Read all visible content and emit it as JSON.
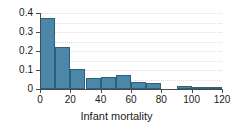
{
  "chart_data": {
    "type": "bar",
    "title": "",
    "subtitle": "",
    "xlabel": "Infant mortality",
    "ylabel": "",
    "xlim": [
      0,
      120
    ],
    "ylim": [
      0,
      0.4
    ],
    "grid": true,
    "legend": null,
    "bin_width": 10,
    "bin_edges": [
      0,
      10,
      20,
      30,
      40,
      50,
      60,
      70,
      80,
      90,
      100,
      110,
      120
    ],
    "categories": [
      "0-10",
      "10-20",
      "20-30",
      "30-40",
      "40-50",
      "50-60",
      "60-70",
      "70-80",
      "80-90",
      "90-100",
      "100-110",
      "110-120"
    ],
    "values": [
      0.375,
      0.222,
      0.105,
      0.056,
      0.062,
      0.074,
      0.036,
      0.031,
      0.0,
      0.015,
      0.01,
      0.004
    ],
    "xticks": [
      0,
      20,
      40,
      60,
      80,
      100,
      120
    ],
    "xticklabels": [
      "0",
      "20",
      "40",
      "60",
      "80",
      "100",
      "120"
    ],
    "yticks": [
      0,
      0.1,
      0.2,
      0.3,
      0.4
    ],
    "yticklabels": [
      "0",
      "0.1",
      "0.2",
      "0.3",
      "0.4"
    ],
    "bar_color": "#4a87a8",
    "bar_edge_color": "#2f5f79",
    "grid_color": "#e7d9db",
    "axis_color": "#4a4a4a",
    "background": "#ffffff"
  }
}
